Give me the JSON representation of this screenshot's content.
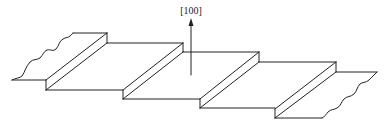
{
  "figure": {
    "type": "crystal surface step diagram",
    "direction_label": "[100]",
    "stroke_color": "#222222",
    "background_color": "#ffffff",
    "arrow": {
      "x": 191,
      "y_tail": 75,
      "y_head": 20
    },
    "steps": [
      {
        "top_x": 107,
        "top_y": 33,
        "bottom_x": 46,
        "bottom_y": 80,
        "height": 10
      },
      {
        "top_x": 183,
        "top_y": 43,
        "bottom_x": 123,
        "bottom_y": 90,
        "height": 9
      },
      {
        "top_x": 259,
        "top_y": 53,
        "bottom_x": 200,
        "bottom_y": 99,
        "height": 9
      },
      {
        "top_x": 336,
        "top_y": 62,
        "bottom_x": 275,
        "bottom_y": 109,
        "height": 9
      }
    ]
  }
}
